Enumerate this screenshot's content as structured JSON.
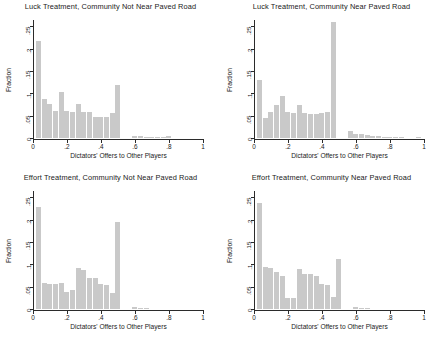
{
  "figure": {
    "bar_color": "#c9c9c9",
    "axis_color": "#2b2b2b",
    "background": "#ffffff"
  },
  "chart_data": [
    {
      "type": "bar",
      "panel": "top-left",
      "title": "Luck Treatment, Community Not Near Paved Road",
      "xlabel": "Dictators' Offers to Other Players",
      "ylabel": "Fraction",
      "xlim": [
        0,
        1
      ],
      "ylim": [
        0,
        0.26
      ],
      "xticks": [
        0,
        0.2,
        0.4,
        0.6,
        0.8,
        1
      ],
      "xticklabels": [
        "0",
        ".2",
        ".4",
        ".6",
        ".8",
        "1"
      ],
      "yticks": [
        0,
        0.05,
        0.1,
        0.15,
        0.2,
        0.25
      ],
      "yticklabels": [
        "0",
        ".05",
        ".1",
        ".15",
        ".2",
        ".25"
      ],
      "grid": false,
      "legend": "none",
      "bin_width": 0.0333,
      "bin_starts": [
        0.017,
        0.05,
        0.083,
        0.117,
        0.15,
        0.183,
        0.217,
        0.25,
        0.283,
        0.317,
        0.35,
        0.383,
        0.417,
        0.45,
        0.483,
        0.517,
        0.55,
        0.583,
        0.617,
        0.65,
        0.683,
        0.717,
        0.75,
        0.783,
        0.817,
        0.85
      ],
      "values": [
        0.218,
        0.088,
        0.077,
        0.061,
        0.103,
        0.06,
        0.058,
        0.076,
        0.058,
        0.058,
        0.047,
        0.046,
        0.046,
        0.056,
        0.119,
        0.0,
        0.0,
        0.004,
        0.004,
        0.003,
        0.003,
        0.003,
        0.003,
        0.005,
        0.0,
        0.0
      ]
    },
    {
      "type": "bar",
      "panel": "top-right",
      "title": "Luck Treatment, Community Near Paved Road",
      "xlabel": "Dictators' Offers to Other Players",
      "ylabel": "Fraction",
      "xlim": [
        0,
        1
      ],
      "ylim": [
        0,
        0.26
      ],
      "xticks": [
        0,
        0.2,
        0.4,
        0.6,
        0.8,
        1
      ],
      "xticklabels": [
        "0",
        ".2",
        ".4",
        ".6",
        ".8",
        "1"
      ],
      "yticks": [
        0,
        0.05,
        0.1,
        0.15,
        0.2,
        0.25
      ],
      "yticklabels": [
        "0",
        ".05",
        ".1",
        ".15",
        ".2",
        ".25"
      ],
      "grid": false,
      "legend": "none",
      "bin_width": 0.0333,
      "bin_starts": [
        0.017,
        0.05,
        0.083,
        0.117,
        0.15,
        0.183,
        0.217,
        0.25,
        0.283,
        0.317,
        0.35,
        0.383,
        0.417,
        0.45,
        0.483,
        0.517,
        0.55,
        0.583,
        0.617,
        0.65,
        0.683,
        0.717,
        0.75,
        0.783,
        0.817,
        0.85,
        0.95
      ],
      "values": [
        0.13,
        0.044,
        0.058,
        0.075,
        0.094,
        0.058,
        0.055,
        0.073,
        0.055,
        0.053,
        0.053,
        0.055,
        0.058,
        0.26,
        0.0,
        0.0,
        0.016,
        0.01,
        0.008,
        0.006,
        0.005,
        0.004,
        0.003,
        0.003,
        0.003,
        0.002,
        0.002
      ]
    },
    {
      "type": "bar",
      "panel": "bottom-left",
      "title": "Effort Treatment, Community Not Near Paved Road",
      "xlabel": "Dictators' Offers to Other Players",
      "ylabel": "Fraction",
      "xlim": [
        0,
        1
      ],
      "ylim": [
        0,
        0.26
      ],
      "xticks": [
        0,
        0.2,
        0.4,
        0.6,
        0.8,
        1
      ],
      "xticklabels": [
        "0",
        ".2",
        ".4",
        ".6",
        ".8",
        "1"
      ],
      "yticks": [
        0,
        0.05,
        0.1,
        0.15,
        0.2,
        0.25
      ],
      "yticklabels": [
        "0",
        ".05",
        ".1",
        ".15",
        ".2",
        ".25"
      ],
      "grid": false,
      "legend": "none",
      "bin_width": 0.0333,
      "bin_starts": [
        0.017,
        0.05,
        0.083,
        0.117,
        0.15,
        0.183,
        0.217,
        0.25,
        0.283,
        0.317,
        0.35,
        0.383,
        0.417,
        0.45,
        0.483,
        0.517,
        0.55,
        0.583,
        0.617,
        0.65
      ],
      "values": [
        0.228,
        0.058,
        0.057,
        0.055,
        0.058,
        0.038,
        0.042,
        0.091,
        0.088,
        0.07,
        0.07,
        0.056,
        0.053,
        0.036,
        0.196,
        0.0,
        0.0,
        0.004,
        0.003,
        0.002
      ]
    },
    {
      "type": "bar",
      "panel": "bottom-right",
      "title": "Effort Treatment, Community Near Paved Road",
      "xlabel": "Dictators' Offers to Other Players",
      "ylabel": "Fraction",
      "xlim": [
        0,
        1
      ],
      "ylim": [
        0,
        0.26
      ],
      "xticks": [
        0,
        0.2,
        0.4,
        0.6,
        0.8,
        1
      ],
      "xticklabels": [
        "0",
        ".2",
        ".4",
        ".6",
        ".8",
        "1"
      ],
      "yticks": [
        0,
        0.05,
        0.1,
        0.15,
        0.2,
        0.25
      ],
      "yticklabels": [
        "0",
        ".05",
        ".1",
        ".15",
        ".2",
        ".25"
      ],
      "grid": false,
      "legend": "none",
      "bin_width": 0.0333,
      "bin_starts": [
        0.017,
        0.05,
        0.083,
        0.117,
        0.15,
        0.183,
        0.217,
        0.25,
        0.283,
        0.317,
        0.35,
        0.383,
        0.417,
        0.45,
        0.483,
        0.517,
        0.55,
        0.583,
        0.617,
        0.65
      ],
      "values": [
        0.237,
        0.095,
        0.092,
        0.082,
        0.075,
        0.025,
        0.024,
        0.089,
        0.079,
        0.078,
        0.073,
        0.056,
        0.054,
        0.026,
        0.113,
        0.0,
        0.0,
        0.005,
        0.003,
        0.002
      ]
    }
  ]
}
